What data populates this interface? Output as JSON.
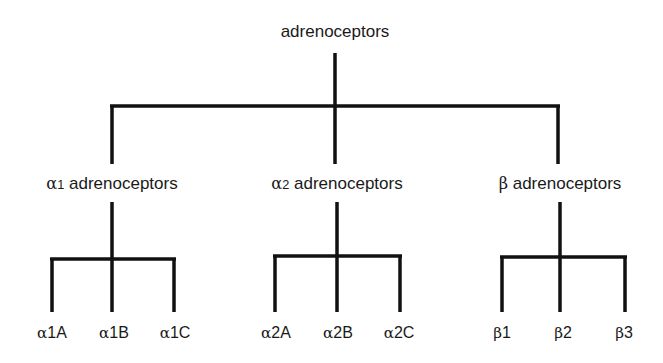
{
  "diagram": {
    "root": {
      "label": "adrenoceptors"
    },
    "groups": [
      {
        "greek": "α",
        "sub": "1",
        "label": " adrenoceptors",
        "children": [
          {
            "greek": "α",
            "rest": "1A"
          },
          {
            "greek": "α",
            "rest": "1B"
          },
          {
            "greek": "α",
            "rest": "1C"
          }
        ]
      },
      {
        "greek": "α",
        "sub": "2",
        "label": " adrenoceptors",
        "children": [
          {
            "greek": "α",
            "rest": "2A"
          },
          {
            "greek": "α",
            "rest": "2B"
          },
          {
            "greek": "α",
            "rest": "2C"
          }
        ]
      },
      {
        "greek": "β",
        "sub": "",
        "label": " adrenoceptors",
        "children": [
          {
            "greek": "β",
            "rest": "1"
          },
          {
            "greek": "β",
            "rest": "2"
          },
          {
            "greek": "β",
            "rest": "3"
          }
        ]
      }
    ],
    "line_color": "#111111"
  }
}
